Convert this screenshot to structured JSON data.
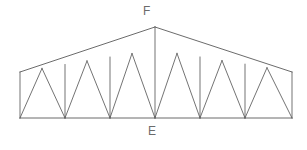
{
  "figure": {
    "name": "truss-diagram",
    "type": "structural-truss",
    "background_color": "#ffffff",
    "line_color": "#5a5a5a",
    "label_color": "#6b6b6b",
    "width": 307,
    "height": 150
  },
  "labels": {
    "apex": "F",
    "bottom_center": "E"
  },
  "geometry": {
    "span": {
      "left_x": 20,
      "right_x": 292,
      "bottom_y": 118,
      "eave_y": 72,
      "apex": {
        "x": 155,
        "y": 27
      }
    },
    "bottom_nodes_x": [
      20,
      65,
      110,
      155,
      200,
      245,
      292
    ],
    "top_nodes": [
      {
        "x": 20,
        "y": 72
      },
      {
        "x": 42,
        "y": 68.36
      },
      {
        "x": 65,
        "y": 64.55
      },
      {
        "x": 87,
        "y": 60.91
      },
      {
        "x": 110,
        "y": 57.1
      },
      {
        "x": 132,
        "y": 53.46
      },
      {
        "x": 155,
        "y": 27
      },
      {
        "x": 177,
        "y": 53.37
      },
      {
        "x": 200,
        "y": 57.04
      },
      {
        "x": 222,
        "y": 60.55
      },
      {
        "x": 245,
        "y": 64.22
      },
      {
        "x": 267,
        "y": 67.73
      },
      {
        "x": 292,
        "y": 72
      }
    ]
  },
  "members": {
    "bottom_chord": "20,118 to 292,118",
    "top_chord_left": "20,72 to 155,27",
    "top_chord_right": "155,27 to 292,72",
    "end_post_left": "20,72 to 20,118",
    "end_post_right": "292,72 to 292,118",
    "center_post": "155,27 to 155,118",
    "verticals_x": [
      65,
      110,
      200,
      245
    ],
    "diagonal_count": 12
  }
}
